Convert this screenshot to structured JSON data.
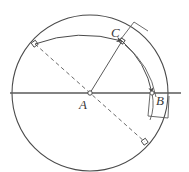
{
  "figure": {
    "kind": "geometry-diagram",
    "width": 189,
    "height": 172,
    "background_color": "#ffffff",
    "stroke_color": "#4a4a4a",
    "line_color": "#5a5a5a",
    "dash_color": "#6a6a6a",
    "label_color": "#3a3a3a"
  },
  "labels": [
    {
      "id": "A",
      "text": "A",
      "role": "circle-center"
    },
    {
      "id": "B",
      "text": "B",
      "role": "point-on-circle-right"
    },
    {
      "id": "C",
      "text": "C",
      "role": "point-on-arc-upper-right"
    }
  ],
  "geometry": {
    "circle": {
      "cx": 90,
      "cy": 93,
      "r": 78,
      "stroke_width": 1.1
    },
    "center_point": {
      "cx": 90,
      "cy": 93,
      "r": 2.2
    },
    "horizontal_line": {
      "x1": 10,
      "y1": 93,
      "x2": 181,
      "y2": 93,
      "stroke_width": 1.3
    },
    "dashed_diameter": {
      "x1": 35,
      "y1": 44,
      "x2": 145,
      "y2": 142,
      "dash": "4 3",
      "stroke_width": 1.0
    },
    "radius_to_C": {
      "x1": 90,
      "y1": 93,
      "x2": 122,
      "y2": 41,
      "stroke_width": 1.0
    },
    "arc_upperleft_to_C": {
      "d": "M 35 44 Q 78 28 122 41",
      "stroke_width": 1.0,
      "has_arrowhead": true
    },
    "arc_C_to_B": {
      "d": "M 122 41 Q 146 62 152 93",
      "stroke_width": 1.0,
      "has_arrowhead": true
    },
    "arc_C_to_B_outer": {
      "d": "M 124 44 Q 150 64 155 96",
      "stroke_width": 0.9
    },
    "markers": [
      {
        "id": "marker-upper-left",
        "cx": 35,
        "cy": 44,
        "size": 4.5,
        "rotate": -35
      },
      {
        "id": "marker-lower-right",
        "cx": 145,
        "cy": 142,
        "size": 4.5,
        "rotate": -35
      },
      {
        "id": "marker-C",
        "cx": 122,
        "cy": 41,
        "size": 4.0,
        "rotate": -58
      },
      {
        "id": "marker-B",
        "cx": 152,
        "cy": 93,
        "size": 3.6,
        "rotate": 0
      }
    ],
    "right_angle_mark_C": {
      "d": "M 122 41 L 133 23 L 146 31"
    },
    "right_angle_mark_B": {
      "d": "M 152 93 L 149 112 L 165 114 L 166 95"
    }
  }
}
